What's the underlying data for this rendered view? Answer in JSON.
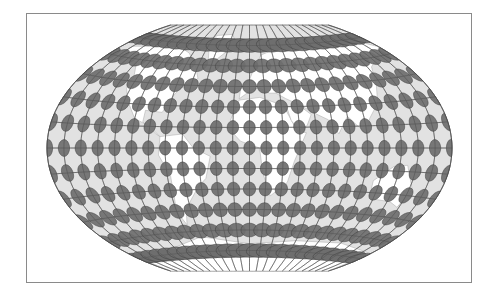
{
  "figure": {
    "projection": "winkel-tripel",
    "frame": {
      "x": 26,
      "y": 13,
      "width": 446,
      "height": 270,
      "stroke": "#8a8a8a"
    },
    "center": {
      "x": 249.5,
      "y": 148
    },
    "half_width_px": 202.5,
    "half_height_px": 123,
    "graticule": {
      "lon_step_deg": 15,
      "lat_step_deg": 15,
      "stroke": "#4a4a4a",
      "stroke_width": 0.6
    },
    "indicatrix": {
      "lons_deg": [
        -180,
        -165,
        -150,
        -135,
        -120,
        -105,
        -90,
        -75,
        -60,
        -45,
        -30,
        -15,
        0,
        15,
        30,
        45,
        60,
        75,
        90,
        105,
        120,
        135,
        150,
        165,
        180
      ],
      "lats_deg": [
        -75,
        -60,
        -45,
        -30,
        -15,
        0,
        15,
        30,
        45,
        60,
        75
      ],
      "radius_deg": 5,
      "fill": "#6e6e6e",
      "stroke": "#3c3c3c",
      "opacity": 0.92
    },
    "colors": {
      "ocean": "#e2e2e2",
      "land": "#ffffff",
      "coast": "#a8a8a8",
      "background": "#ffffff"
    }
  }
}
